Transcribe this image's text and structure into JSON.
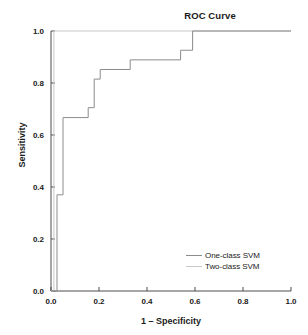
{
  "chart_data": {
    "type": "line",
    "title": "ROC Curve",
    "xlabel": "1 – Specificity",
    "ylabel": "Sensitivity",
    "xlim": [
      0.0,
      1.0
    ],
    "ylim": [
      0.0,
      1.0
    ],
    "grid": false,
    "legend_position": "lower-right-inside",
    "xticks": [
      "0.0",
      "0.2",
      "0.4",
      "0.6",
      "0.8",
      "1.0"
    ],
    "xtick_values": [
      0.0,
      0.2,
      0.4,
      0.6,
      0.8,
      1.0
    ],
    "yticks": [
      "0.0",
      "0.2",
      "0.4",
      "0.6",
      "0.8",
      "1.0"
    ],
    "ytick_values": [
      0.0,
      0.2,
      0.4,
      0.6,
      0.8,
      1.0
    ],
    "series": [
      {
        "name": "One-class SVM",
        "color": "#8c8c8c",
        "drawstyle": "steps-post",
        "x": [
          0.0,
          0.025,
          0.025,
          0.05,
          0.05,
          0.155,
          0.155,
          0.18,
          0.18,
          0.205,
          0.205,
          0.33,
          0.33,
          0.54,
          0.54,
          0.59,
          0.59,
          1.0
        ],
        "y": [
          0.0,
          0.0,
          0.37,
          0.37,
          0.667,
          0.667,
          0.705,
          0.705,
          0.815,
          0.815,
          0.852,
          0.852,
          0.889,
          0.889,
          0.926,
          0.926,
          1.0,
          1.0
        ]
      },
      {
        "name": "Two-class SVM",
        "color": "#c8c8c8",
        "drawstyle": "steps-post",
        "x": [
          0.0,
          0.012,
          0.012,
          1.0
        ],
        "y": [
          0.0,
          0.0,
          1.0,
          1.0
        ]
      }
    ]
  },
  "legend": {
    "items": [
      {
        "label": "One-class SVM",
        "color": "#8c8c8c"
      },
      {
        "label": "Two-class SVM",
        "color": "#c8c8c8"
      }
    ]
  },
  "axes": {
    "title": "ROC Curve",
    "x_axis_label": "1 – Specificity",
    "y_axis_label": "Sensitivity",
    "axis_color": "#4d4d4d"
  }
}
